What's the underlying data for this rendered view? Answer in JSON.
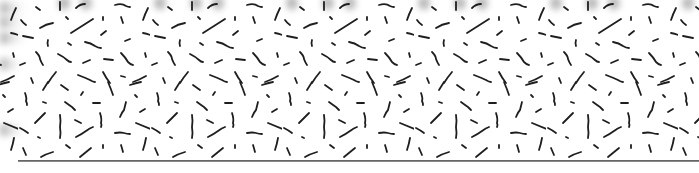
{
  "image": {
    "description": "Decorative noise texture of short black random dashes on white, repeating horizontally, with a dark baseline near the bottom",
    "background_color": "#ffffff",
    "stroke_color": "#1e1e1e",
    "baseline_color": "#555555",
    "tile_period_px": 132,
    "tile_offset_x_px": 18
  }
}
